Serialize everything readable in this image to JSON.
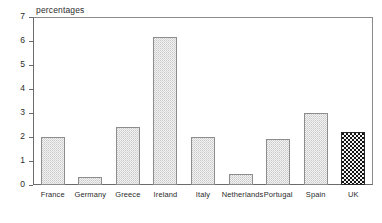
{
  "chart_data": {
    "type": "bar",
    "title": "",
    "ylabel": "percentages",
    "xlabel": "",
    "categories": [
      "France",
      "Germany",
      "Greece",
      "Ireland",
      "Italy",
      "Netherlands",
      "Portugal",
      "Spain",
      "UK"
    ],
    "values": [
      2.0,
      0.33,
      2.4,
      6.15,
      2.0,
      0.45,
      1.9,
      3.0,
      2.2
    ],
    "ylim": [
      0,
      7
    ],
    "yticks": [
      0,
      1,
      2,
      3,
      4,
      5,
      6,
      7
    ],
    "ytick_labels": [
      "0",
      "1",
      "2",
      "3",
      "4",
      "5",
      "6",
      "7"
    ],
    "grid": false,
    "legend": null,
    "series": [
      {
        "name": "percentages",
        "values": [
          2.0,
          0.33,
          2.4,
          6.15,
          2.0,
          0.45,
          1.9,
          3.0,
          2.2
        ]
      }
    ],
    "bar_styles": [
      "stipple-light",
      "stipple-light",
      "stipple-light",
      "stipple-light",
      "stipple-light",
      "stipple-light",
      "stipple-light",
      "stipple-light",
      "checker-dark"
    ],
    "colors": {
      "bar_fill_light": "#f2f2f2",
      "bar_edge_light": "#8d8d8d",
      "bar_fill_dark": "#111111",
      "bar_edge_dark": "#2a2a2a",
      "axis": "#6b6b6b",
      "text": "#2b2b2b",
      "background": "#ffffff"
    }
  }
}
